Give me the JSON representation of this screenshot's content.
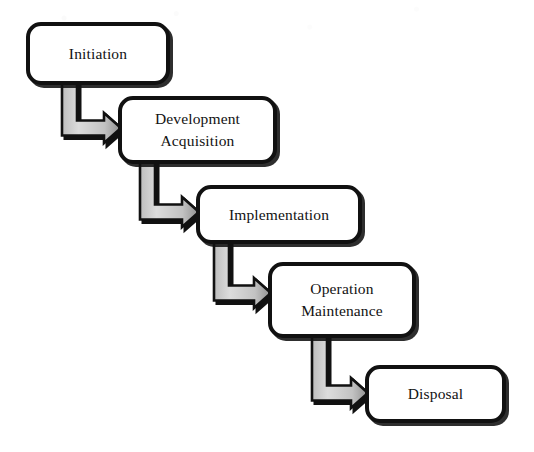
{
  "diagram": {
    "header_faint_text": "",
    "background_color": "#ffffff",
    "box_border_color": "#111111",
    "box_fill_color": "#ffffff",
    "arrow_fill_light": "#d8d8d8",
    "arrow_fill_dark": "#9a9a9a",
    "arrow_outline_color": "#111111",
    "shadow_color": "#111111",
    "stages": [
      {
        "id": "initiation",
        "label": "Initiation",
        "x": 26,
        "y": 22,
        "width": 144,
        "height": 63
      },
      {
        "id": "development-acquisition",
        "label": "Development\nAcquisition",
        "x": 118,
        "y": 96,
        "width": 159,
        "height": 68
      },
      {
        "id": "implementation",
        "label": "Implementation",
        "x": 196,
        "y": 185,
        "width": 166,
        "height": 59
      },
      {
        "id": "operation-maintenance",
        "label": "Operation\nMaintenance",
        "x": 268,
        "y": 262,
        "width": 148,
        "height": 76
      },
      {
        "id": "disposal",
        "label": "Disposal",
        "x": 365,
        "y": 365,
        "width": 141,
        "height": 58
      }
    ],
    "connectors": [
      {
        "id": "initiation-to-development",
        "from": "initiation",
        "to": "development-acquisition",
        "shaft_x": 62,
        "shaft_top": 82,
        "shaft_width": 15,
        "elbow_y": 113,
        "arrow_tip_x": 121,
        "arrow_center_y": 128
      },
      {
        "id": "development-to-implementation",
        "from": "development-acquisition",
        "to": "implementation",
        "shaft_x": 140,
        "shaft_top": 160,
        "shaft_width": 15,
        "elbow_y": 197,
        "arrow_tip_x": 199,
        "arrow_center_y": 212
      },
      {
        "id": "implementation-to-operation",
        "from": "implementation",
        "to": "operation-maintenance",
        "shaft_x": 214,
        "shaft_top": 240,
        "shaft_width": 15,
        "elbow_y": 278,
        "arrow_tip_x": 271,
        "arrow_center_y": 293
      },
      {
        "id": "operation-to-disposal",
        "from": "operation-maintenance",
        "to": "disposal",
        "shaft_x": 312,
        "shaft_top": 334,
        "shaft_width": 15,
        "elbow_y": 378,
        "arrow_tip_x": 368,
        "arrow_center_y": 393
      }
    ]
  }
}
